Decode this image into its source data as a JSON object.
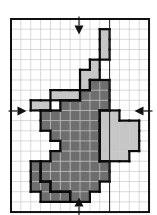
{
  "grid": {
    "cols": 14,
    "rows": 19,
    "origin_x": 11,
    "origin_y": 19,
    "cell_w": 9.86,
    "cell_h": 10.16,
    "divider_col": 10
  },
  "colors": {
    "background": "#ffffff",
    "grid_line": "#c8c8c8",
    "frame": "#111111",
    "dark_region": "#6e6e6e",
    "light_region": "#c6c6c6",
    "outline": "#0a0a0a"
  },
  "regions": {
    "light_top": [
      [
        9,
        1
      ],
      [
        9,
        2
      ],
      [
        9,
        3
      ],
      [
        8,
        4
      ],
      [
        8,
        5
      ],
      [
        7,
        6
      ],
      [
        7,
        5
      ],
      [
        6,
        7
      ],
      [
        5,
        7
      ],
      [
        4,
        7
      ],
      [
        3,
        8
      ],
      [
        2,
        8
      ]
    ],
    "dark_main": [
      [
        8,
        6
      ],
      [
        9,
        6
      ],
      [
        7,
        7
      ],
      [
        8,
        7
      ],
      [
        9,
        7
      ],
      [
        5,
        8
      ],
      [
        6,
        8
      ],
      [
        7,
        8
      ],
      [
        8,
        8
      ],
      [
        9,
        8
      ],
      [
        3,
        9
      ],
      [
        4,
        9
      ],
      [
        5,
        9
      ],
      [
        6,
        9
      ],
      [
        7,
        9
      ],
      [
        8,
        9
      ],
      [
        9,
        9
      ],
      [
        3,
        10
      ],
      [
        4,
        10
      ],
      [
        5,
        10
      ],
      [
        6,
        10
      ],
      [
        7,
        10
      ],
      [
        8,
        10
      ],
      [
        4,
        11
      ],
      [
        5,
        11
      ],
      [
        6,
        11
      ],
      [
        7,
        11
      ],
      [
        8,
        11
      ],
      [
        5,
        12
      ],
      [
        6,
        12
      ],
      [
        7,
        12
      ],
      [
        8,
        12
      ],
      [
        4,
        13
      ],
      [
        5,
        13
      ],
      [
        6,
        13
      ],
      [
        7,
        13
      ],
      [
        8,
        13
      ],
      [
        9,
        13
      ],
      [
        3,
        14
      ],
      [
        4,
        14
      ],
      [
        5,
        14
      ],
      [
        6,
        14
      ],
      [
        7,
        14
      ],
      [
        8,
        14
      ],
      [
        9,
        14
      ],
      [
        3,
        15
      ],
      [
        4,
        15
      ],
      [
        5,
        15
      ],
      [
        6,
        15
      ],
      [
        7,
        15
      ],
      [
        8,
        15
      ],
      [
        9,
        15
      ],
      [
        4,
        16
      ],
      [
        5,
        16
      ],
      [
        6,
        16
      ],
      [
        7,
        16
      ],
      [
        8,
        16
      ],
      [
        6,
        17
      ],
      [
        7,
        17
      ]
    ],
    "dark_sub": [
      [
        2,
        14
      ],
      [
        2,
        15
      ],
      [
        3,
        16
      ],
      [
        2,
        16
      ],
      [
        3,
        17
      ],
      [
        4,
        17
      ],
      [
        5,
        17
      ]
    ],
    "light_right": [
      [
        9,
        9
      ],
      [
        10,
        9
      ],
      [
        9,
        10
      ],
      [
        10,
        10
      ],
      [
        11,
        10
      ],
      [
        12,
        10
      ],
      [
        9,
        11
      ],
      [
        10,
        11
      ],
      [
        11,
        11
      ],
      [
        12,
        11
      ],
      [
        9,
        12
      ],
      [
        10,
        12
      ],
      [
        11,
        12
      ],
      [
        12,
        12
      ],
      [
        9,
        13
      ],
      [
        10,
        13
      ],
      [
        11,
        13
      ]
    ]
  },
  "arrows": [
    {
      "name": "arrow-top",
      "dir": "down",
      "x": 79,
      "y": 30
    },
    {
      "name": "arrow-bottom",
      "dir": "up",
      "x": 79,
      "y": 202
    },
    {
      "name": "arrow-left",
      "dir": "right",
      "x": 22,
      "y": 111
    },
    {
      "name": "arrow-right",
      "dir": "left",
      "x": 139,
      "y": 111
    }
  ]
}
